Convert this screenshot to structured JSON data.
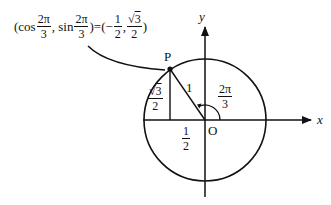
{
  "equation": {
    "open": "(cos",
    "frac1_num": "2π",
    "frac1_den": "3",
    "sep1": ", sin",
    "frac2_num": "2π",
    "frac2_den": "3",
    "equals": ")=(−",
    "frac3_num": "1",
    "frac3_den": "2",
    "comma": ",",
    "frac4_num_root": "√",
    "frac4_num_val": "3",
    "frac4_den": "2",
    "close": ")"
  },
  "labels": {
    "point": "P",
    "origin": "O",
    "x_axis": "x",
    "y_axis": "y",
    "radius": "1",
    "angle_num": "2π",
    "angle_den": "3",
    "height_num_root": "√",
    "height_num_val": "3",
    "height_den": "2",
    "base_num": "1",
    "base_den": "2"
  },
  "geometry": {
    "origin": [
      205,
      120
    ],
    "radius": 61,
    "point_P": [
      170,
      69
    ],
    "angle": "2π/3",
    "stroke_color": "#111111"
  }
}
